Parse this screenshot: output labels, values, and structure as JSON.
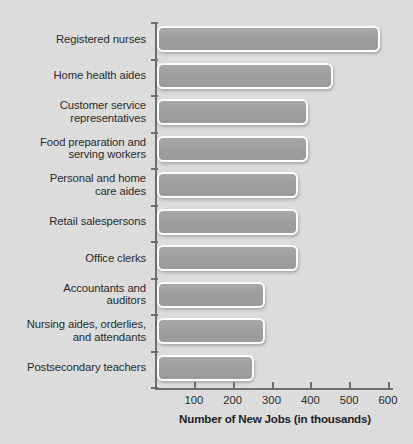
{
  "chart_data": {
    "type": "bar",
    "orientation": "horizontal",
    "title": "",
    "xlabel": "Number of New Jobs (in thousands)",
    "ylabel": "",
    "xlim": [
      0,
      600
    ],
    "xticks": [
      100,
      200,
      300,
      400,
      500,
      600
    ],
    "xtick_labels": [
      "100",
      "200",
      "300",
      "400",
      "500",
      "600"
    ],
    "grid": false,
    "legend": null,
    "categories": [
      "Registered nurses",
      "Home health aides",
      "Customer service representatives",
      "Food preparation and serving workers",
      "Personal and home care aides",
      "Retail salespersons",
      "Office clerks",
      "Accountants and auditors",
      "Nursing aides, orderlies, and attendants",
      "Postsecondary teachers"
    ],
    "category_lines": [
      [
        "Registered nurses"
      ],
      [
        "Home health aides"
      ],
      [
        "Customer service",
        "representatives"
      ],
      [
        "Food preparation and",
        "serving workers"
      ],
      [
        "Personal and home",
        "care aides"
      ],
      [
        "Retail salespersons"
      ],
      [
        "Office clerks"
      ],
      [
        "Accountants and",
        "auditors"
      ],
      [
        "Nursing aides, orderlies,",
        "and attendants"
      ],
      [
        "Postsecondary teachers"
      ]
    ],
    "values": [
      575,
      452,
      390,
      390,
      362,
      362,
      362,
      278,
      278,
      250
    ]
  },
  "colors": {
    "background": "#dcdcdc",
    "bar_fill": "#9e9e9e",
    "bar_border": "#fdfdfd",
    "axis": "#6f6f6f",
    "text": "#2b2b2b"
  }
}
